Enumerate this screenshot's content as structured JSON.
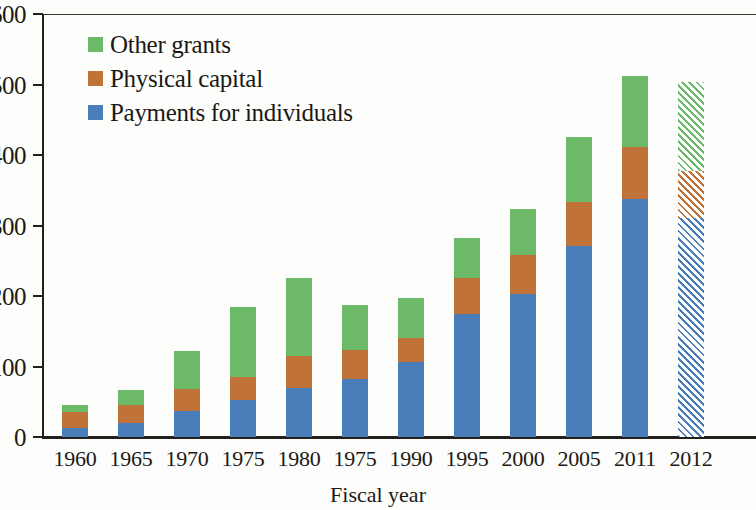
{
  "chart_data": {
    "type": "bar",
    "stacked": true,
    "title": "",
    "xlabel": "Fiscal year",
    "ylabel": "",
    "ylim": [
      0,
      600
    ],
    "yticks": [
      0,
      100,
      200,
      300,
      400,
      500,
      600
    ],
    "ytick_labels": [
      "0",
      "100",
      "200",
      "300",
      "400",
      "500",
      "600"
    ],
    "grid": false,
    "legend_position": "top-left",
    "categories": [
      "1960",
      "1965",
      "1970",
      "1975",
      "1980",
      "1975",
      "1990",
      "1995",
      "2000",
      "2005",
      "2011",
      "2012"
    ],
    "series": [
      {
        "name": "Payments for individuals",
        "color": "#4a7ebb",
        "values": [
          13,
          20,
          37,
          52,
          69,
          83,
          107,
          175,
          203,
          271,
          337,
          310
        ]
      },
      {
        "name": "Physical capital",
        "color": "#c07239",
        "values": [
          22,
          26,
          31,
          33,
          46,
          40,
          33,
          50,
          55,
          62,
          75,
          68
        ]
      },
      {
        "name": "Other grants",
        "color": "#6cba68",
        "values": [
          10,
          20,
          54,
          100,
          110,
          65,
          57,
          57,
          66,
          92,
          100,
          125
        ]
      }
    ],
    "totals": [
      45,
      66,
      122,
      185,
      225,
      188,
      197,
      282,
      324,
      425,
      512,
      503
    ],
    "legend_order": [
      "Other grants",
      "Physical capital",
      "Payments for individuals"
    ],
    "projected_categories": [
      "2012"
    ],
    "projected_note": "hatched bar indicates estimate"
  }
}
